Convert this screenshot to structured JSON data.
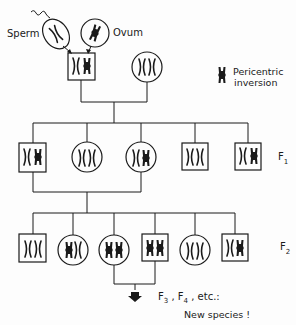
{
  "labels": {
    "sperm": "Sperm",
    "ovum": "Ovum",
    "legend_line1": "Pericentric",
    "legend_line2": "inversion",
    "f1": "F",
    "f1_sub": "1",
    "f2": "F",
    "f2_sub": "2",
    "f3": "F",
    "f3_sub": "3",
    "f4": "F",
    "f4_sub": "4",
    "etc": "etc.:",
    "new_species": "New species !"
  },
  "legend": {
    "icon": "inverted-chromosome-icon",
    "meaning": "Pericentric inversion"
  },
  "generations": {
    "parents": [
      {
        "shape": "box",
        "sex": "male",
        "chromosomes": [
          "normal",
          "inverted"
        ],
        "origin": "sperm + ovum"
      },
      {
        "shape": "circle",
        "sex": "female",
        "chromosomes": [
          "normal",
          "normal"
        ]
      }
    ],
    "gametes": [
      {
        "name": "Sperm",
        "chromosome": "normal"
      },
      {
        "name": "Ovum",
        "chromosome": "inverted"
      }
    ],
    "F1": [
      {
        "shape": "box",
        "chromosomes": [
          "normal",
          "inverted"
        ]
      },
      {
        "shape": "circle",
        "chromosomes": [
          "normal",
          "normal"
        ]
      },
      {
        "shape": "circle",
        "chromosomes": [
          "normal",
          "inverted"
        ]
      },
      {
        "shape": "box",
        "chromosomes": [
          "normal",
          "normal"
        ]
      },
      {
        "shape": "box",
        "chromosomes": [
          "normal",
          "inverted"
        ]
      }
    ],
    "F2": [
      {
        "shape": "box",
        "chromosomes": [
          "normal",
          "normal"
        ]
      },
      {
        "shape": "circle",
        "chromosomes": [
          "inverted",
          "normal"
        ]
      },
      {
        "shape": "circle",
        "chromosomes": [
          "inverted",
          "inverted"
        ]
      },
      {
        "shape": "box",
        "chromosomes": [
          "inverted",
          "inverted"
        ]
      },
      {
        "shape": "circle",
        "chromosomes": [
          "normal",
          "normal"
        ]
      },
      {
        "shape": "box",
        "chromosomes": [
          "normal",
          "inverted"
        ]
      }
    ]
  },
  "colors": {
    "line": "#1a1a1a",
    "background": "#fdfdfd"
  }
}
